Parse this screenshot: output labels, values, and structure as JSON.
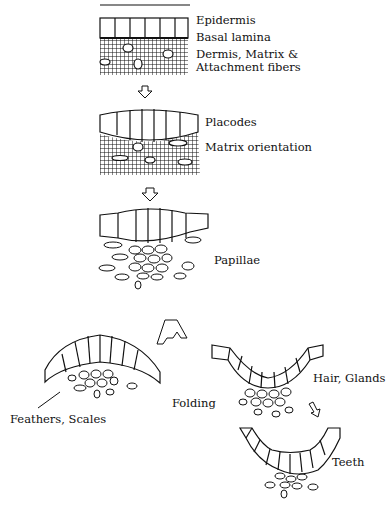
{
  "diagram": {
    "labels": {
      "epidermis": "Epidermis",
      "basal_lamina": "Basal lamina",
      "dermis_line1": "Dermis, Matrix &",
      "dermis_line2": "Attachment fibers",
      "placodes": "Placodes",
      "matrix_orientation": "Matrix orientation",
      "papillae": "Papillae",
      "folding": "Folding",
      "hair_glands": "Hair, Glands",
      "feathers_scales": "Feathers, Scales",
      "teeth": "Teeth"
    },
    "stages": [
      "Flat epidermis over dermis",
      "Placode formation",
      "Papilla formation",
      "Outward fold (feathers, scales)",
      "Inward fold (hair, glands)",
      "Inward fold (teeth)"
    ],
    "colors": {
      "ink": "#111111",
      "background": "#ffffff"
    }
  }
}
